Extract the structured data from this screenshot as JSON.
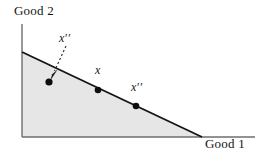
{
  "figure": {
    "name": "budget-set-diagram",
    "background_color": "#ffffff",
    "ink_color": "#141414",
    "shade_color": "#e6e6e6",
    "axes": {
      "vertical": {
        "label": "Good 2",
        "x": 22,
        "y_top": 24,
        "y_bottom": 137
      },
      "horizontal": {
        "label": "Good 1",
        "y": 137,
        "x_left": 22,
        "x_right": 255
      }
    },
    "budget_line": {
      "name": "budget-line",
      "x1": 22,
      "y1": 52,
      "x2": 202,
      "y2": 137
    },
    "shaded_region": {
      "name": "feasible-set",
      "fill": "#e6e6e6",
      "points": "22,52 202,137 22,137"
    },
    "points": [
      {
        "name": "interior-bundle",
        "label": "x",
        "primes": "′′",
        "cx": 49,
        "cy": 82,
        "on_line": false
      },
      {
        "name": "bundle-x",
        "label": "x",
        "primes": "",
        "cx": 98,
        "cy": 90,
        "on_line": true
      },
      {
        "name": "boundary-bundle",
        "label": "x",
        "primes": "′′",
        "cx": 136,
        "cy": 106,
        "on_line": true
      }
    ],
    "leader_arrow": {
      "name": "leader-arrow",
      "style": "dashed",
      "x1": 66,
      "y1": 46,
      "x2": 53,
      "y2": 74
    }
  }
}
